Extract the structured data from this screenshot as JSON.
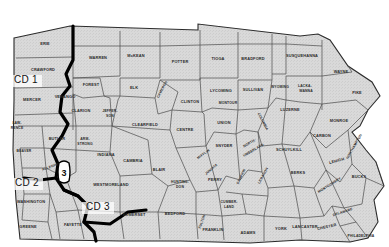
{
  "map": {
    "title": "Pennsylvania Congressional Districts County Map",
    "background_color": "#ffffff",
    "county_fill_color": "#d9d9d9",
    "county_border_color": "#3a3a3a",
    "district_border_color": "#000000",
    "label_color": "#2a2a2a"
  },
  "district_labels": [
    {
      "id": "cd1",
      "text": "CD 1",
      "x": 26,
      "y": 83
    },
    {
      "id": "cd2",
      "text": "CD 2",
      "x": 27,
      "y": 186
    },
    {
      "id": "cd3",
      "text": "CD 3",
      "x": 98,
      "y": 210
    }
  ],
  "callouts": [
    {
      "id": "callout-3",
      "text": "3",
      "x": 64,
      "y": 172
    }
  ],
  "counties": [
    {
      "name": "ERIE",
      "x": 45,
      "y": 45,
      "size": "normal",
      "rotate": 0
    },
    {
      "name": "CRAWFORD",
      "x": 43,
      "y": 71,
      "size": "normal",
      "rotate": 0
    },
    {
      "name": "MERCER",
      "x": 32,
      "y": 101,
      "size": "normal",
      "rotate": 0
    },
    {
      "name": "LAW-",
      "x": 17,
      "y": 124,
      "size": "sm",
      "rotate": 0
    },
    {
      "name": "RENCE",
      "x": 17,
      "y": 129,
      "size": "sm",
      "rotate": 0
    },
    {
      "name": "BEAVER",
      "x": 24,
      "y": 152,
      "size": "sm",
      "rotate": 0
    },
    {
      "name": "BUTLER",
      "x": 57,
      "y": 140,
      "size": "normal",
      "rotate": 0
    },
    {
      "name": "VENANGO",
      "x": 65,
      "y": 98,
      "size": "normal",
      "rotate": 0
    },
    {
      "name": "FOREST",
      "x": 91,
      "y": 86,
      "size": "normal",
      "rotate": 0
    },
    {
      "name": "WARREN",
      "x": 98,
      "y": 59,
      "size": "normal",
      "rotate": 0
    },
    {
      "name": "McKEAN",
      "x": 136,
      "y": 57,
      "size": "normal",
      "rotate": 0
    },
    {
      "name": "POTTER",
      "x": 180,
      "y": 63,
      "size": "normal",
      "rotate": 0
    },
    {
      "name": "TIOGA",
      "x": 218,
      "y": 60,
      "size": "normal",
      "rotate": 0
    },
    {
      "name": "BRADFORD",
      "x": 253,
      "y": 60,
      "size": "normal",
      "rotate": 0
    },
    {
      "name": "SUSQUEHANNA",
      "x": 302,
      "y": 57,
      "size": "normal",
      "rotate": 0
    },
    {
      "name": "WAYNE",
      "x": 341,
      "y": 73,
      "size": "normal",
      "rotate": 0
    },
    {
      "name": "ELK",
      "x": 134,
      "y": 89,
      "size": "normal",
      "rotate": 0
    },
    {
      "name": "CAMERON",
      "x": 163,
      "y": 90,
      "size": "sm",
      "rotate": -62
    },
    {
      "name": "CLARION",
      "x": 81,
      "y": 112,
      "size": "normal",
      "rotate": 0
    },
    {
      "name": "JEFFER-",
      "x": 110,
      "y": 112,
      "size": "sm",
      "rotate": 0
    },
    {
      "name": "SON",
      "x": 110,
      "y": 117,
      "size": "sm",
      "rotate": 0
    },
    {
      "name": "CLEARFIELD",
      "x": 145,
      "y": 126,
      "size": "normal",
      "rotate": 0
    },
    {
      "name": "CLINTON",
      "x": 190,
      "y": 103,
      "size": "normal",
      "rotate": 0
    },
    {
      "name": "LYCOMING",
      "x": 221,
      "y": 92,
      "size": "normal",
      "rotate": 0
    },
    {
      "name": "SULLIVAN",
      "x": 253,
      "y": 91,
      "size": "normal",
      "rotate": 0
    },
    {
      "name": "WYOMING",
      "x": 280,
      "y": 88,
      "size": "sm",
      "rotate": 0
    },
    {
      "name": "LACKA-",
      "x": 305,
      "y": 87,
      "size": "sm",
      "rotate": 0
    },
    {
      "name": "WANNA",
      "x": 306,
      "y": 92,
      "size": "sm",
      "rotate": 0
    },
    {
      "name": "PIKE",
      "x": 357,
      "y": 94,
      "size": "normal",
      "rotate": 0
    },
    {
      "name": "MONTOUR",
      "x": 228,
      "y": 104,
      "size": "sm",
      "rotate": 0
    },
    {
      "name": "CENTRE",
      "x": 185,
      "y": 131,
      "size": "normal",
      "rotate": 0
    },
    {
      "name": "UNION",
      "x": 224,
      "y": 124,
      "size": "normal",
      "rotate": 0
    },
    {
      "name": "COLUMBIA",
      "x": 262,
      "y": 122,
      "size": "sm",
      "rotate": 62
    },
    {
      "name": "LUZERNE",
      "x": 290,
      "y": 111,
      "size": "normal",
      "rotate": 0
    },
    {
      "name": "MONROE",
      "x": 339,
      "y": 122,
      "size": "normal",
      "rotate": 0
    },
    {
      "name": "ARM-",
      "x": 85,
      "y": 140,
      "size": "sm",
      "rotate": 0
    },
    {
      "name": "STRONG",
      "x": 85,
      "y": 145,
      "size": "sm",
      "rotate": 0
    },
    {
      "name": "INDIANA",
      "x": 106,
      "y": 156,
      "size": "normal",
      "rotate": 0
    },
    {
      "name": "CAMBRIA",
      "x": 133,
      "y": 162,
      "size": "normal",
      "rotate": 0
    },
    {
      "name": "BLAIR",
      "x": 159,
      "y": 171,
      "size": "normal",
      "rotate": 0
    },
    {
      "name": "MIFFLIN",
      "x": 204,
      "y": 155,
      "size": "sm",
      "rotate": -35
    },
    {
      "name": "SNYDER",
      "x": 224,
      "y": 147,
      "size": "normal",
      "rotate": 0
    },
    {
      "name": "NORTH-",
      "x": 250,
      "y": 144,
      "size": "sm",
      "rotate": -30
    },
    {
      "name": "UMBERLAND",
      "x": 254,
      "y": 151,
      "size": "sm",
      "rotate": -30
    },
    {
      "name": "SCHUYLKILL",
      "x": 289,
      "y": 151,
      "size": "normal",
      "rotate": 0
    },
    {
      "name": "CARBON",
      "x": 322,
      "y": 137,
      "size": "normal",
      "rotate": 0
    },
    {
      "name": "NORTHAMPTON",
      "x": 355,
      "y": 147,
      "size": "sm",
      "rotate": -60
    },
    {
      "name": "LEHIGH",
      "x": 337,
      "y": 162,
      "size": "normal",
      "rotate": -15
    },
    {
      "name": "WESTMORELAND",
      "x": 111,
      "y": 186,
      "size": "normal",
      "rotate": 0
    },
    {
      "name": "HUNTING-",
      "x": 180,
      "y": 183,
      "size": "sm",
      "rotate": 0
    },
    {
      "name": "DON",
      "x": 180,
      "y": 188,
      "size": "sm",
      "rotate": 0
    },
    {
      "name": "JUNIATA",
      "x": 212,
      "y": 170,
      "size": "sm",
      "rotate": -40
    },
    {
      "name": "PERRY",
      "x": 215,
      "y": 181,
      "size": "normal",
      "rotate": 0
    },
    {
      "name": "DAUPHIN",
      "x": 242,
      "y": 177,
      "size": "sm",
      "rotate": -65
    },
    {
      "name": "LEBANON",
      "x": 264,
      "y": 176,
      "size": "sm",
      "rotate": -62
    },
    {
      "name": "BERKS",
      "x": 298,
      "y": 174,
      "size": "normal",
      "rotate": 0
    },
    {
      "name": "MONTGOMERY",
      "x": 330,
      "y": 186,
      "size": "sm",
      "rotate": -32
    },
    {
      "name": "BUCKS",
      "x": 359,
      "y": 178,
      "size": "normal",
      "rotate": 0
    },
    {
      "name": "WASHINGTON",
      "x": 31,
      "y": 203,
      "size": "normal",
      "rotate": 0
    },
    {
      "name": "ALLEGHENY",
      "x": 53,
      "y": 167,
      "size": "sm",
      "rotate": -20
    },
    {
      "name": "GREENE",
      "x": 28,
      "y": 228,
      "size": "normal",
      "rotate": 0
    },
    {
      "name": "FAYETTE",
      "x": 73,
      "y": 226,
      "size": "normal",
      "rotate": 0
    },
    {
      "name": "SOMERSET",
      "x": 134,
      "y": 216,
      "size": "normal",
      "rotate": 0
    },
    {
      "name": "BEDFORD",
      "x": 175,
      "y": 215,
      "size": "normal",
      "rotate": 0
    },
    {
      "name": "FULTON",
      "x": 203,
      "y": 222,
      "size": "sm",
      "rotate": -70
    },
    {
      "name": "FRANKLIN",
      "x": 213,
      "y": 231,
      "size": "normal",
      "rotate": 0
    },
    {
      "name": "CUMBER-",
      "x": 229,
      "y": 203,
      "size": "sm",
      "rotate": 0
    },
    {
      "name": "LAND",
      "x": 229,
      "y": 208,
      "size": "sm",
      "rotate": 0
    },
    {
      "name": "ADAMS",
      "x": 248,
      "y": 234,
      "size": "normal",
      "rotate": 0
    },
    {
      "name": "YORK",
      "x": 281,
      "y": 230,
      "size": "normal",
      "rotate": 0
    },
    {
      "name": "LANCASTER",
      "x": 305,
      "y": 228,
      "size": "normal",
      "rotate": 0
    },
    {
      "name": "DELAWARE",
      "x": 343,
      "y": 213,
      "size": "sm",
      "rotate": -18
    },
    {
      "name": "CHESTER",
      "x": 327,
      "y": 228,
      "size": "normal",
      "rotate": -12
    },
    {
      "name": "PHILADELPHIA",
      "x": 361,
      "y": 237,
      "size": "sm",
      "rotate": 0
    }
  ]
}
